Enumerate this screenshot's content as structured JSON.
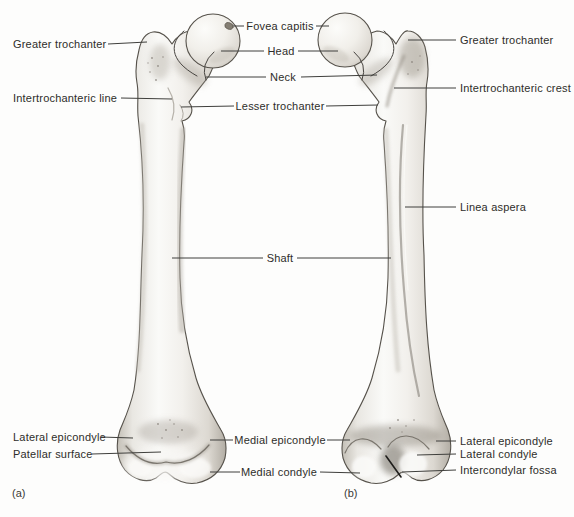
{
  "figure": {
    "view_a_caption": "(a)",
    "view_b_caption": "(b)"
  },
  "labels": {
    "greater_trochanter_left": "Greater trochanter",
    "intertrochanteric_line": "Intertrochanteric line",
    "fovea_capitis": "Fovea capitis",
    "head": "Head",
    "neck": "Neck",
    "lesser_trochanter": "Lesser trochanter",
    "greater_trochanter_right": "Greater trochanter",
    "intertrochanteric_crest": "Intertrochanteric crest",
    "linea_aspera": "Linea aspera",
    "shaft": "Shaft",
    "lateral_epicondyle_left": "Lateral epicondyle",
    "patellar_surface": "Patellar surface",
    "medial_epicondyle": "Medial epicondyle",
    "medial_condyle": "Medial condyle",
    "lateral_epicondyle_right": "Lateral epicondyle",
    "lateral_condyle": "Lateral condyle",
    "intercondylar_fossa": "Intercondylar fossa"
  },
  "colors": {
    "background": "#fdfdfc",
    "bone_outline": "#56524b",
    "bone_fill_light": "#f6f5f2",
    "bone_shadow": "#b1aca3",
    "leader_line": "#3f3f3c",
    "text": "#2e2d2a"
  }
}
